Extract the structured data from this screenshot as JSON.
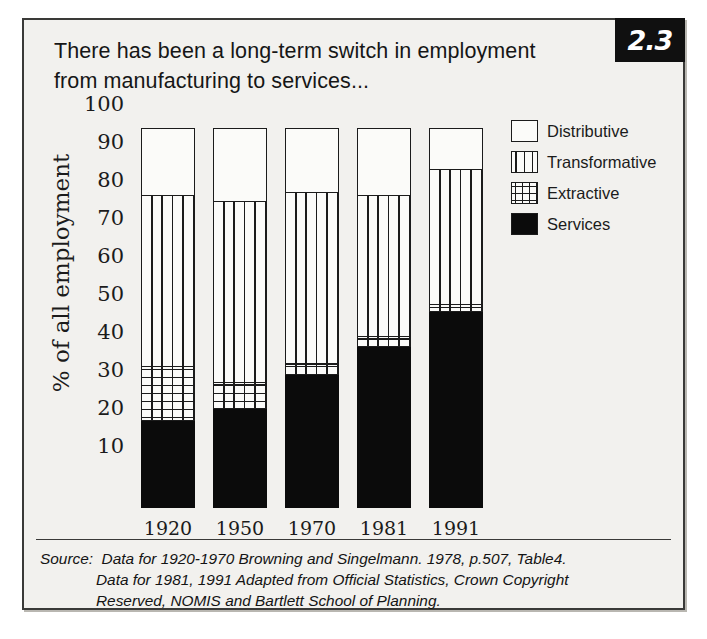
{
  "figure": {
    "number": "2.3",
    "title_line1": "There has been a long-term switch in employment",
    "title_line2": "from manufacturing to services..."
  },
  "legend": {
    "items": [
      {
        "label": "Distributive",
        "pattern": "empty",
        "key": "distributive"
      },
      {
        "label": "Transformative",
        "pattern": "vertical",
        "key": "transformative"
      },
      {
        "label": "Extractive",
        "pattern": "crosshatch",
        "key": "extractive"
      },
      {
        "label": "Services",
        "pattern": "solid-black",
        "key": "services"
      }
    ]
  },
  "source": {
    "label": "Source:",
    "line1": "Data for 1920-1970 Browning and Singelmann. 1978, p.507, Table4.",
    "line2": "Data for 1981, 1991 Adapted from Official Statistics, Crown Copyright",
    "line3": "Reserved, NOMIS and Bartlett School of Planning."
  },
  "chart_data": {
    "type": "bar",
    "stacked": true,
    "title": "There has been a long-term switch in employment from manufacturing to services...",
    "xlabel": "",
    "ylabel": "% of all employment",
    "ylim": [
      0,
      100
    ],
    "yticks": [
      100,
      90,
      80,
      70,
      60,
      50,
      40,
      30,
      20,
      10
    ],
    "grid": false,
    "legend_position": "top-right",
    "categories": [
      "1920",
      "1950",
      "1970",
      "1981",
      "1991"
    ],
    "series": [
      {
        "name": "Services",
        "values": [
          23.0,
          26.0,
          35.0,
          42.5,
          51.5
        ]
      },
      {
        "name": "Extractive",
        "values": [
          14.0,
          7.0,
          3.0,
          2.5,
          2.0
        ]
      },
      {
        "name": "Transformative",
        "values": [
          45.0,
          47.5,
          45.0,
          37.0,
          35.5
        ]
      },
      {
        "name": "Distributive",
        "values": [
          18.0,
          19.5,
          17.0,
          18.0,
          11.0
        ]
      }
    ],
    "cumulative_tops": {
      "1920": {
        "services": 23.0,
        "extractive": 37.0,
        "transformative": 82.0,
        "distributive": 100
      },
      "1950": {
        "services": 26.0,
        "extractive": 33.0,
        "transformative": 80.5,
        "distributive": 100
      },
      "1970": {
        "services": 35.0,
        "extractive": 38.0,
        "transformative": 83.0,
        "distributive": 100
      },
      "1981": {
        "services": 42.5,
        "extractive": 45.0,
        "transformative": 82.0,
        "distributive": 100
      },
      "1991": {
        "services": 51.5,
        "extractive": 53.5,
        "transformative": 89.0,
        "distributive": 100
      }
    }
  }
}
